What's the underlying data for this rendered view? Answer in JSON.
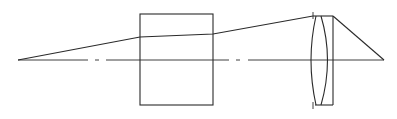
{
  "diagram": {
    "type": "optical-layout",
    "colors": {
      "line": "#2a2a2a",
      "background": "#ffffff"
    },
    "optical_axis": {
      "y": 60,
      "x_start": 18,
      "x_end": 384,
      "style": "dash-dot"
    },
    "elements": [
      {
        "id": "object-point",
        "x": 18,
        "y": 60
      },
      {
        "id": "glass-block",
        "x": 140,
        "y": 14,
        "width": 73,
        "height": 91
      },
      {
        "id": "doublet-lens",
        "x": 313,
        "y": 16,
        "width": 20,
        "height": 89
      },
      {
        "id": "focal-point",
        "x": 384,
        "y": 60
      }
    ],
    "ray_path": [
      [
        18,
        60
      ],
      [
        140,
        37
      ],
      [
        213,
        34
      ],
      [
        313,
        16
      ],
      [
        333,
        16
      ],
      [
        384,
        60
      ]
    ]
  }
}
